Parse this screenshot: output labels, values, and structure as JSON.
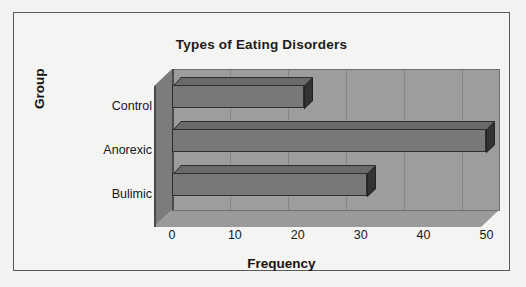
{
  "chart_data": {
    "type": "bar",
    "orientation": "horizontal",
    "title": "Types of Eating Disorders",
    "xlabel": "Frequency",
    "ylabel": "Group",
    "categories": [
      "Bulimic",
      "Anorexic",
      "Control"
    ],
    "values": [
      31,
      50,
      21
    ],
    "xticks": [
      0,
      10,
      20,
      30,
      40,
      50
    ],
    "xlim": [
      0,
      52
    ],
    "grid": true,
    "legend": false,
    "style": "3d",
    "colors": {
      "bar_face": "#787878",
      "bar_edge": "#2e2e2e",
      "plot_background": "#9d9d9d",
      "page_background": "#f3f3f1",
      "frame_border": "#5a5a5a",
      "text": "#171717"
    }
  }
}
